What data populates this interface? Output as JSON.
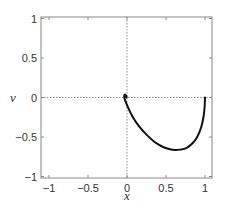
{
  "chart_data": {
    "type": "line",
    "title": "",
    "xlabel": "x",
    "ylabel": "v",
    "xlim": [
      -1.15,
      1.05
    ],
    "ylim": [
      -1,
      1
    ],
    "xticks": [
      -1,
      -0.5,
      0,
      0.5,
      1
    ],
    "xtick_labels": [
      "−1",
      "−0.5",
      "0",
      "0.5",
      "1"
    ],
    "yticks": [
      1,
      0.5,
      0,
      -0.5,
      -1
    ],
    "ytick_labels": [
      "1",
      "0.5",
      "0",
      "−0.5",
      "−1"
    ],
    "grid": false,
    "zero_lines": true,
    "legend": null,
    "series": [
      {
        "name": "trajectory",
        "color": "#111111",
        "x": [
          1.0,
          0.995,
          0.98,
          0.95,
          0.9,
          0.84,
          0.76,
          0.68,
          0.62,
          0.55,
          0.45,
          0.35,
          0.25,
          0.15,
          0.07,
          0.02,
          -0.01,
          -0.03,
          -0.035,
          -0.03,
          -0.02,
          -0.01,
          -0.005
        ],
        "y": [
          0.0,
          -0.12,
          -0.25,
          -0.38,
          -0.5,
          -0.58,
          -0.64,
          -0.66,
          -0.665,
          -0.655,
          -0.62,
          -0.56,
          -0.47,
          -0.36,
          -0.24,
          -0.14,
          -0.07,
          -0.02,
          0.02,
          0.035,
          0.035,
          0.02,
          0.0
        ]
      }
    ]
  }
}
